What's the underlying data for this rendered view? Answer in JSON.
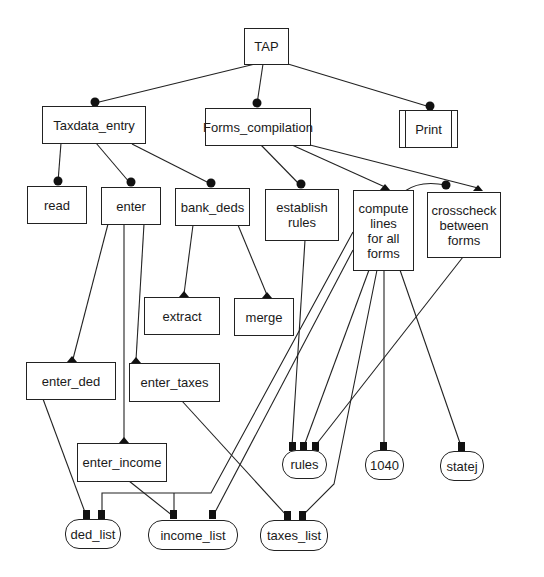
{
  "diagram": {
    "title": "TAP",
    "modules": [
      {
        "id": "tap",
        "label": "TAP"
      },
      {
        "id": "taxdata_entry",
        "label": "Taxdata_entry"
      },
      {
        "id": "forms_compilation",
        "label": "Forms_compilation"
      },
      {
        "id": "print",
        "label": "Print"
      },
      {
        "id": "read",
        "label": "read"
      },
      {
        "id": "enter",
        "label": "enter"
      },
      {
        "id": "bank_deds",
        "label": "bank_deds"
      },
      {
        "id": "establish_rules",
        "label": "establish\nrules"
      },
      {
        "id": "compute_lines",
        "label": "compute\nlines\nfor all\nforms"
      },
      {
        "id": "crosscheck",
        "label": "crosscheck\nbetween\nforms"
      },
      {
        "id": "extract",
        "label": "extract"
      },
      {
        "id": "merge",
        "label": "merge"
      },
      {
        "id": "enter_ded",
        "label": "enter_ded"
      },
      {
        "id": "enter_taxes",
        "label": "enter_taxes"
      },
      {
        "id": "enter_income",
        "label": "enter_income"
      }
    ],
    "data_stores": [
      {
        "id": "rules",
        "label": "rules"
      },
      {
        "id": "f1040",
        "label": "1040"
      },
      {
        "id": "statej",
        "label": "statej"
      },
      {
        "id": "ded_list",
        "label": "ded_list"
      },
      {
        "id": "income_list",
        "label": "income_list"
      },
      {
        "id": "taxes_list",
        "label": "taxes_list"
      }
    ],
    "calls": [
      {
        "from": "TAP",
        "to": "Taxdata_entry"
      },
      {
        "from": "TAP",
        "to": "Forms_compilation"
      },
      {
        "from": "TAP",
        "to": "Print"
      },
      {
        "from": "Taxdata_entry",
        "to": "read"
      },
      {
        "from": "Taxdata_entry",
        "to": "enter"
      },
      {
        "from": "Taxdata_entry",
        "to": "bank_deds"
      },
      {
        "from": "Forms_compilation",
        "to": "establish rules"
      },
      {
        "from": "Forms_compilation",
        "to": "compute lines for all forms"
      },
      {
        "from": "Forms_compilation",
        "to": "crosscheck between forms"
      },
      {
        "from": "compute lines for all forms",
        "to": "crosscheck between forms"
      },
      {
        "from": "bank_deds",
        "to": "extract"
      },
      {
        "from": "bank_deds",
        "to": "merge"
      },
      {
        "from": "enter",
        "to": "enter_ded"
      },
      {
        "from": "enter",
        "to": "enter_taxes"
      },
      {
        "from": "enter",
        "to": "enter_income"
      }
    ],
    "data_access": [
      {
        "from": "enter_ded",
        "to": "ded_list"
      },
      {
        "from": "enter_income",
        "to": "income_list"
      },
      {
        "from": "enter_taxes",
        "to": "taxes_list"
      },
      {
        "from": "establish rules",
        "to": "rules"
      },
      {
        "from": "compute lines for all forms",
        "to": "rules"
      },
      {
        "from": "crosscheck between forms",
        "to": "rules"
      },
      {
        "from": "compute lines for all forms",
        "to": "1040"
      },
      {
        "from": "compute lines for all forms",
        "to": "statej"
      },
      {
        "from": "compute lines for all forms",
        "to": "ded_list"
      },
      {
        "from": "compute lines for all forms",
        "to": "income_list"
      },
      {
        "from": "compute lines for all forms",
        "to": "taxes_list"
      }
    ]
  }
}
